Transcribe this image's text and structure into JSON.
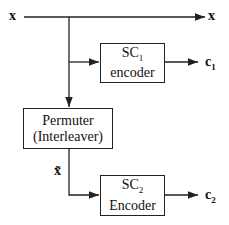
{
  "diagram": {
    "input_label": "x",
    "output_x_label": "x",
    "sc1": {
      "name": "SC",
      "sub": "1",
      "line2": "encoder"
    },
    "c1": {
      "name": "c",
      "sub": "1"
    },
    "permuter": {
      "line1": "Permuter",
      "line2": "(Interleaver)"
    },
    "xtilde_label": "x̃",
    "sc2": {
      "name": "SC",
      "sub": "2",
      "line2": "Encoder"
    },
    "c2": {
      "name": "c",
      "sub": "2"
    }
  }
}
